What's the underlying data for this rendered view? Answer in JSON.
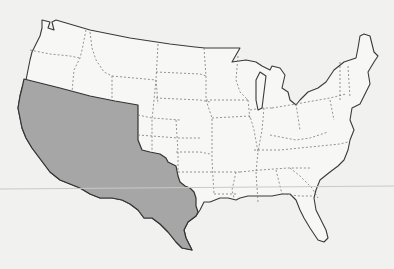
{
  "map": {
    "title": "Contiguous United States with shaded region",
    "region_label": "Mexican Cession and Texas",
    "colors": {
      "background": "#f1f1f0",
      "land": "#f7f7f6",
      "shaded_region": "#a6a6a6",
      "border": "#3a3a3a",
      "state_lines": "#7a7a7a"
    },
    "legend": []
  }
}
